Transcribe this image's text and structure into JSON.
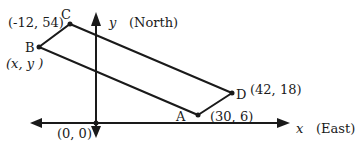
{
  "diagram": {
    "axes": {
      "x_label": "x",
      "x_direction": "(East)",
      "y_label": "y",
      "y_direction": "(North)",
      "origin_label": "(0, 0)"
    },
    "points": {
      "A": {
        "name": "A",
        "coord": "(30, 6)"
      },
      "B": {
        "name": "B",
        "coord": "(x, y )"
      },
      "C": {
        "name": "C",
        "coord": "(-12, 54)"
      },
      "D": {
        "name": "D",
        "coord": "(42, 18)"
      }
    },
    "shape": "parallelogram ABCD (A→D→C→B)",
    "colors": {
      "line": "#1a1a1a",
      "background": "#ffffff"
    }
  }
}
